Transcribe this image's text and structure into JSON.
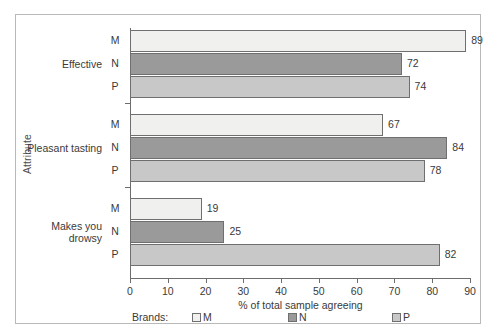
{
  "chart_data": {
    "type": "bar",
    "orientation": "horizontal",
    "title": "",
    "xlabel": "% of total sample agreeing",
    "ylabel": "Attribute",
    "xlim": [
      0,
      90
    ],
    "xticks": [
      0,
      10,
      20,
      30,
      40,
      50,
      60,
      70,
      80,
      90
    ],
    "grid": false,
    "legend_position": "bottom",
    "legend_title": "Brands:",
    "categories": [
      "Effective",
      "Pleasant tasting",
      "Makes you drowsy"
    ],
    "series": [
      {
        "name": "M",
        "color": "#f0f0ee",
        "values": [
          89,
          67,
          19
        ]
      },
      {
        "name": "N",
        "color": "#9a9a9a",
        "values": [
          72,
          84,
          25
        ]
      },
      {
        "name": "P",
        "color": "#c8c8c8",
        "values": [
          74,
          78,
          82
        ]
      }
    ],
    "groups": [
      {
        "label": "Effective",
        "label_lines": [
          "Effective"
        ],
        "bars": [
          {
            "brand": "M",
            "value": 89,
            "value_label": "89",
            "color": "#f0f0ee"
          },
          {
            "brand": "N",
            "value": 72,
            "value_label": "72",
            "color": "#9a9a9a"
          },
          {
            "brand": "P",
            "value": 74,
            "value_label": "74",
            "color": "#c8c8c8"
          }
        ]
      },
      {
        "label": "Pleasant tasting",
        "label_lines": [
          "Pleasant tasting"
        ],
        "bars": [
          {
            "brand": "M",
            "value": 67,
            "value_label": "67",
            "color": "#f0f0ee"
          },
          {
            "brand": "N",
            "value": 84,
            "value_label": "84",
            "color": "#9a9a9a"
          },
          {
            "brand": "P",
            "value": 78,
            "value_label": "78",
            "color": "#c8c8c8"
          }
        ]
      },
      {
        "label": "Makes you drowsy",
        "label_lines": [
          "Makes you",
          "drowsy"
        ],
        "bars": [
          {
            "brand": "M",
            "value": 19,
            "value_label": "19",
            "color": "#f0f0ee"
          },
          {
            "brand": "N",
            "value": 25,
            "value_label": "25",
            "color": "#9a9a9a"
          },
          {
            "brand": "P",
            "value": 82,
            "value_label": "82",
            "color": "#c8c8c8"
          }
        ]
      }
    ]
  },
  "axis": {
    "y_title": "Attribute",
    "x_title": "% of total sample agreeing",
    "x_tick_labels": [
      "0",
      "10",
      "20",
      "30",
      "40",
      "50",
      "60",
      "70",
      "80",
      "90"
    ]
  },
  "legend": {
    "title": "Brands:",
    "items": [
      {
        "label": "M",
        "color": "#f0f0ee"
      },
      {
        "label": "N",
        "color": "#9a9a9a"
      },
      {
        "label": "P",
        "color": "#c8c8c8"
      }
    ]
  }
}
